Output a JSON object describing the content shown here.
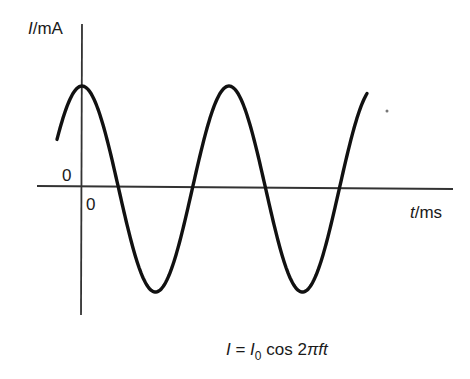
{
  "chart_data": {
    "type": "line",
    "title": "",
    "xlabel": "t/ms",
    "ylabel": "I/mA",
    "xlabel_parts": {
      "var": "t",
      "unit": "/ms"
    },
    "ylabel_parts": {
      "var": "I",
      "unit": "/mA"
    },
    "x_origin_label": "0",
    "y_origin_label": "0",
    "x_ticks": [],
    "y_ticks": [],
    "grid": false,
    "legend": null,
    "series": [
      {
        "name": "I = I0 cos 2πft",
        "function": "cosine",
        "amplitude": "I0",
        "phase_at_origin": "maximum",
        "periods_shown": 2,
        "x_start_periods": -0.17,
        "x_end_periods": 1.94,
        "color": "#111111"
      }
    ],
    "annotations": [
      {
        "text": "I = I0 cos 2πft",
        "position": "below chart"
      }
    ]
  },
  "caption": {
    "lhs": "I",
    "eq": " = ",
    "amp": "I",
    "amp_sub": "0",
    "rest": " cos 2",
    "pi": "π",
    "vars": "ft"
  }
}
